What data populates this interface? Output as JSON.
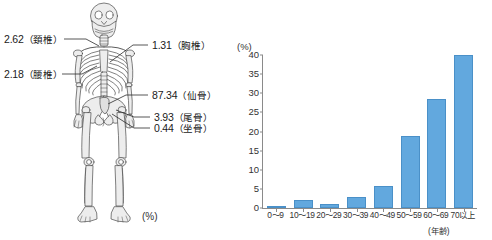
{
  "diagram": {
    "unit_label": "(%)",
    "title_icon": "skeleton-icon",
    "callouts": [
      {
        "id": "cervical",
        "value": "2.62",
        "part": "（頚椎）",
        "side": "left"
      },
      {
        "id": "lumbar",
        "value": "2.18",
        "part": "（腰椎）",
        "side": "left"
      },
      {
        "id": "thoracic",
        "value": "1.31",
        "part": "（胸椎）",
        "side": "right"
      },
      {
        "id": "sacrum",
        "value": "87.34",
        "part": "（仙骨）",
        "side": "right"
      },
      {
        "id": "coccyx",
        "value": "3.93",
        "part": "（尾骨）",
        "side": "right"
      },
      {
        "id": "ischium",
        "value": "0.44",
        "part": "（坐骨）",
        "side": "right"
      }
    ]
  },
  "chart_data": {
    "type": "bar",
    "title": "",
    "xlabel": "(年齢)",
    "ylabel": "(%)",
    "ylim": [
      0,
      40
    ],
    "yticks": [
      0,
      5,
      10,
      15,
      20,
      25,
      30,
      35,
      40
    ],
    "grid": false,
    "legend": null,
    "bar_color": "#62A8DE",
    "bar_border_color": "#4A90C8",
    "categories": [
      "0〜9",
      "10〜19",
      "20〜29",
      "30〜39",
      "40〜49",
      "50〜59",
      "60〜69",
      "70以上"
    ],
    "values": [
      0.3,
      2.1,
      1.1,
      3.0,
      5.8,
      18.7,
      28.6,
      40.0
    ]
  }
}
